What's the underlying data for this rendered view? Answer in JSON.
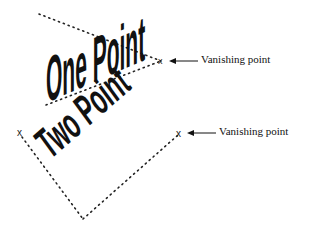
{
  "diagram": {
    "one_point": {
      "word": "One Point",
      "vanishing_label": "Vanishing point",
      "marker": "x"
    },
    "two_point": {
      "word": "Two Point",
      "vanishing_label": "Vanishing point",
      "marker_left": "x",
      "marker_right": "x"
    }
  },
  "colors": {
    "ink": "#111111",
    "background": "#ffffff"
  }
}
